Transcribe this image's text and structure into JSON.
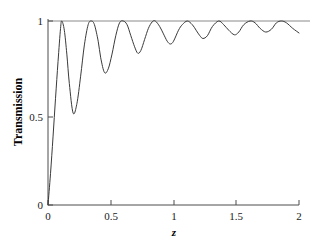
{
  "chart_data": {
    "type": "line",
    "title": "",
    "xlabel": "z",
    "ylabel": "Transmission",
    "xlim": [
      0,
      2
    ],
    "ylim": [
      0,
      1
    ],
    "grid": false,
    "legend": null,
    "xticks": [
      0,
      0.5,
      1,
      1.5,
      2
    ],
    "xticklabels": [
      "0",
      "0.5",
      "1",
      "1.5",
      "2"
    ],
    "yticks": [
      0,
      0.5,
      1
    ],
    "yticklabels": [
      "0",
      "0.5",
      "1"
    ],
    "reference_line": {
      "name": "unity-transmission-asymptote",
      "orientation": "horizontal",
      "y": 1,
      "x_start": 0,
      "x_end": 2,
      "color": "#8a8a8a"
    },
    "series": [
      {
        "name": "Transmission",
        "color": "#3a3a3a",
        "peaks_x": [
          0.11,
          0.345,
          0.6,
          0.855,
          1.11,
          1.36,
          1.61,
          1.86
        ],
        "peaks_y": [
          1.0,
          1.0,
          1.0,
          1.0,
          1.0,
          1.0,
          1.0,
          1.0
        ],
        "minima_x": [
          0.2,
          0.45,
          0.715,
          0.975,
          1.235,
          1.485,
          1.735
        ],
        "minima_y": [
          0.5,
          0.72,
          0.825,
          0.875,
          0.905,
          0.925,
          0.94
        ],
        "x": [
          0.0,
          0.02,
          0.04,
          0.06,
          0.08,
          0.1,
          0.11,
          0.13,
          0.15,
          0.17,
          0.2,
          0.23,
          0.26,
          0.29,
          0.32,
          0.345,
          0.37,
          0.4,
          0.42,
          0.45,
          0.48,
          0.51,
          0.54,
          0.57,
          0.6,
          0.63,
          0.66,
          0.69,
          0.715,
          0.74,
          0.77,
          0.8,
          0.83,
          0.855,
          0.89,
          0.92,
          0.95,
          0.975,
          1.0,
          1.04,
          1.07,
          1.11,
          1.15,
          1.18,
          1.21,
          1.235,
          1.27,
          1.31,
          1.36,
          1.4,
          1.44,
          1.485,
          1.52,
          1.56,
          1.61,
          1.65,
          1.69,
          1.735,
          1.78,
          1.82,
          1.86,
          1.9,
          1.95,
          2.0
        ],
        "y": [
          0.0,
          0.17,
          0.37,
          0.58,
          0.78,
          0.96,
          1.0,
          0.95,
          0.82,
          0.66,
          0.5,
          0.55,
          0.7,
          0.87,
          0.98,
          1.0,
          0.98,
          0.89,
          0.8,
          0.72,
          0.74,
          0.82,
          0.92,
          0.99,
          1.0,
          0.98,
          0.92,
          0.86,
          0.825,
          0.84,
          0.9,
          0.96,
          0.995,
          1.0,
          0.97,
          0.93,
          0.89,
          0.875,
          0.89,
          0.95,
          0.98,
          1.0,
          0.98,
          0.95,
          0.92,
          0.905,
          0.92,
          0.97,
          1.0,
          0.98,
          0.95,
          0.925,
          0.94,
          0.98,
          1.0,
          0.99,
          0.96,
          0.94,
          0.955,
          0.99,
          1.0,
          0.99,
          0.96,
          0.935
        ]
      }
    ]
  },
  "figure": {
    "background_color": "#ffffff",
    "axis_color": "#4d4d4d",
    "curve_color": "#3a3a3a",
    "reference_color": "#8a8a8a"
  }
}
